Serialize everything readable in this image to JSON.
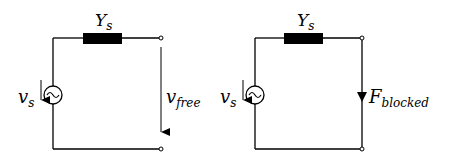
{
  "diagram": {
    "title": "",
    "circuits": [
      {
        "name": "free-circuit",
        "impedance_label": "Y",
        "impedance_sub": "s",
        "source_label": "v",
        "source_sub": "s",
        "output_label": "v",
        "output_sub": "free",
        "output_type": "voltage-arrow"
      },
      {
        "name": "blocked-circuit",
        "impedance_label": "Y",
        "impedance_sub": "s",
        "source_label": "v",
        "source_sub": "s",
        "output_label": "F",
        "output_sub": "blocked",
        "output_type": "current-arrow"
      }
    ],
    "colors": {
      "line": "#000000",
      "background": "#ffffff"
    }
  }
}
